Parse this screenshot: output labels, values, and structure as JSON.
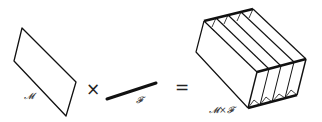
{
  "diagram": {
    "base": {
      "label": "𝓜"
    },
    "operator_times": "×",
    "fiber": {
      "label": "𝓕"
    },
    "operator_equals": "=",
    "product": {
      "label": "𝓜×𝓕",
      "slices": 4
    },
    "colors": {
      "stroke": "#111111",
      "background": "#ffffff",
      "label": "#333333"
    }
  }
}
